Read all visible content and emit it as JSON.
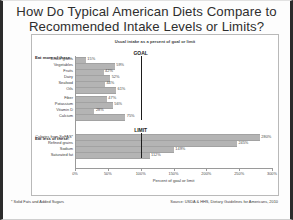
{
  "slide": {
    "title_line1": "How Do Typical American Diets Compare to",
    "title_line2": "Recommended Intake Levels or Limits?",
    "footnote": "* Solid Fats and Added Sugars",
    "source": "Source: USDA & HHS, Dietary Guidelines for Americans, 2010"
  },
  "chart_data": {
    "type": "bar",
    "orientation": "horizontal",
    "title": "Usual intake as a percent of goal or limit",
    "xlabel": "Percent of goal or limit",
    "ylabel": "",
    "xlim": [
      0,
      300
    ],
    "xticks": [
      0,
      50,
      100,
      150,
      200,
      250,
      300
    ],
    "xtick_labels": [
      "0%",
      "50%",
      "100%",
      "150%",
      "200%",
      "250%",
      "300%"
    ],
    "grid": false,
    "legend": "none",
    "reference_lines": [
      {
        "label": "GOAL",
        "value": 100,
        "group": "Eat more of these"
      },
      {
        "label": "LIMIT",
        "value": 100,
        "group": "Eat less of these"
      }
    ],
    "groups": [
      {
        "name": "Eat more of these:",
        "categories": [
          "Whole grains",
          "Vegetables",
          "Fruits",
          "Dairy",
          "Seafood",
          "Oils",
          "Fiber",
          "Potassium",
          "Vitamin D",
          "Calcium"
        ],
        "values": [
          15,
          59,
          42,
          52,
          44,
          61,
          47,
          56,
          28,
          75
        ],
        "value_labels": [
          "15%",
          "59%",
          "42%",
          "52%",
          "44%",
          "61%",
          "47%",
          "56%",
          "28%",
          "75%"
        ]
      },
      {
        "name": "Eat less of these:",
        "categories": [
          "Calories from SoFAS*",
          "Refined grains",
          "Sodium",
          "Saturated fat"
        ],
        "values": [
          280,
          245,
          149,
          112
        ],
        "value_labels": [
          "280%",
          "245%",
          "149%",
          "112%"
        ]
      }
    ]
  }
}
